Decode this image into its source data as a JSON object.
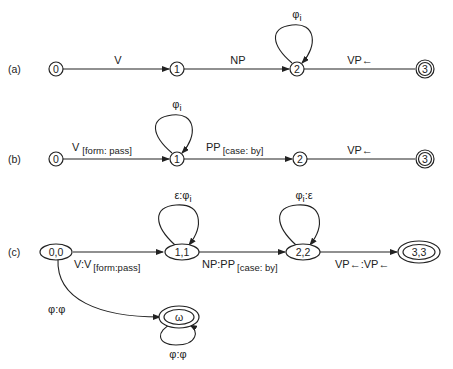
{
  "figure": {
    "parts": [
      {
        "id": "a",
        "label": "(a)",
        "nodes": [
          {
            "id": "0",
            "label": "0",
            "final": false
          },
          {
            "id": "1",
            "label": "1",
            "final": false
          },
          {
            "id": "2",
            "label": "2",
            "final": false
          },
          {
            "id": "3",
            "label": "3",
            "final": true
          }
        ],
        "edges": [
          {
            "from": "0",
            "to": "1",
            "label": "V",
            "sub": ""
          },
          {
            "from": "1",
            "to": "2",
            "label": "NP",
            "sub": ""
          },
          {
            "from": "2",
            "to": "2",
            "label": "φ",
            "sub": "i"
          },
          {
            "from": "2",
            "to": "3",
            "label": "VP←",
            "sub": ""
          }
        ]
      },
      {
        "id": "b",
        "label": "(b)",
        "nodes": [
          {
            "id": "0",
            "label": "0",
            "final": false
          },
          {
            "id": "1",
            "label": "1",
            "final": false
          },
          {
            "id": "2",
            "label": "2",
            "final": false
          },
          {
            "id": "3",
            "label": "3",
            "final": true
          }
        ],
        "edges": [
          {
            "from": "0",
            "to": "1",
            "label": "V",
            "sub": "[form: pass]"
          },
          {
            "from": "1",
            "to": "1",
            "label": "φ",
            "sub": "i"
          },
          {
            "from": "1",
            "to": "2",
            "label": "PP",
            "sub": "[case: by]"
          },
          {
            "from": "2",
            "to": "3",
            "label": "VP←",
            "sub": ""
          }
        ]
      },
      {
        "id": "c",
        "label": "(c)",
        "nodes": [
          {
            "id": "0,0",
            "label": "0,0",
            "final": false
          },
          {
            "id": "1,1",
            "label": "1,1",
            "final": false
          },
          {
            "id": "2,2",
            "label": "2,2",
            "final": false
          },
          {
            "id": "3,3",
            "label": "3,3",
            "final": true
          },
          {
            "id": "ω",
            "label": "ω",
            "final": true
          }
        ],
        "edges": [
          {
            "from": "0,0",
            "to": "1,1",
            "label": "V:V",
            "sub": "[form:pass]"
          },
          {
            "from": "1,1",
            "to": "1,1",
            "label": "ε:φ",
            "sub": "i"
          },
          {
            "from": "1,1",
            "to": "2,2",
            "label": "NP:PP",
            "sub": "[case: by]"
          },
          {
            "from": "2,2",
            "to": "2,2",
            "label": "φ",
            "sub": "i",
            "suffix": ":ε"
          },
          {
            "from": "2,2",
            "to": "3,3",
            "label": "VP←:VP←",
            "sub": ""
          },
          {
            "from": "0,0",
            "to": "ω",
            "label": "φ:φ",
            "sub": ""
          },
          {
            "from": "ω",
            "to": "ω",
            "label": "φ:φ",
            "sub": ""
          }
        ]
      }
    ]
  },
  "colors": {
    "ink": "#222222",
    "background": "#ffffff"
  }
}
